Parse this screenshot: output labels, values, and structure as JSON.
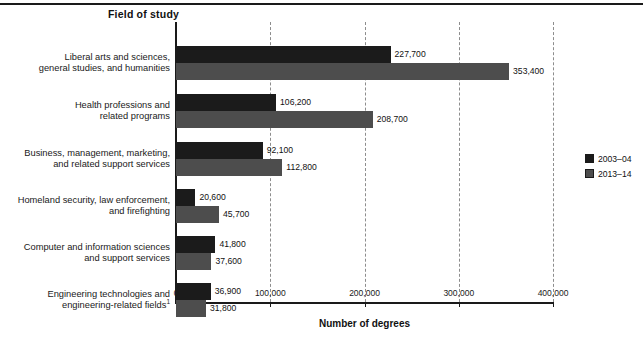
{
  "chart_title": "Field of study",
  "x_axis_label": "Number of degrees",
  "legend": {
    "items": [
      {
        "label": "2003–04",
        "color": "#1b1b1b"
      },
      {
        "label": "2013–14",
        "color": "#4d4d4d"
      }
    ]
  },
  "axis": {
    "ticks": [
      {
        "value": 0,
        "label": "0"
      },
      {
        "value": 100000,
        "label": "100,000"
      },
      {
        "value": 200000,
        "label": "200,000"
      },
      {
        "value": 300000,
        "label": "300,000"
      },
      {
        "value": 400000,
        "label": "400,000"
      }
    ]
  },
  "chart_data": {
    "type": "bar",
    "orientation": "horizontal",
    "title": "Field of study",
    "xlabel": "Number of degrees",
    "ylabel": "Field of study",
    "xlim": [
      0,
      400000
    ],
    "grid": true,
    "legend_position": "right",
    "categories": [
      "Liberal arts and sciences, general studies, and humanities",
      "Health professions and related programs",
      "Business, management, marketing, and related support services",
      "Homeland security, law enforcement, and firefighting",
      "Computer and information sciences and support services",
      "Engineering technologies and engineering-related fields"
    ],
    "category_lines": [
      [
        "Liberal arts and sciences,",
        "general studies, and humanities"
      ],
      [
        "Health professions and",
        "related programs"
      ],
      [
        "Business, management, marketing,",
        "and related support services"
      ],
      [
        "Homeland security, law enforcement,",
        "and firefighting"
      ],
      [
        "Computer and information sciences",
        "and support services"
      ],
      [
        "Engineering technologies and",
        "engineering-related fields"
      ]
    ],
    "category_footnotes": [
      "",
      "",
      "",
      "",
      "",
      "1"
    ],
    "series": [
      {
        "name": "2003–04",
        "color": "#1b1b1b",
        "values": [
          227700,
          106200,
          92100,
          20600,
          41800,
          36900
        ],
        "labels": [
          "227,700",
          "106,200",
          "92,100",
          "20,600",
          "41,800",
          "36,900"
        ]
      },
      {
        "name": "2013–14",
        "color": "#4d4d4d",
        "values": [
          353400,
          208700,
          112800,
          45700,
          37600,
          31800
        ],
        "labels": [
          "353,400",
          "208,700",
          "112,800",
          "45,700",
          "37,600",
          "31,800"
        ]
      }
    ]
  }
}
